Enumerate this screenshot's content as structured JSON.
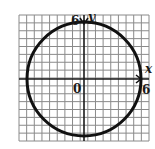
{
  "diagram": {
    "type": "circle-on-coordinate-grid",
    "equation_implied": "x^2 + y^2 = 36",
    "center": {
      "x": 0,
      "y": 0
    },
    "radius": 6,
    "axes": {
      "x_label": "x",
      "y_label": "y",
      "origin_label": "0"
    },
    "tick_labels": {
      "x_positive": "6",
      "y_positive": "6"
    },
    "grid": {
      "cols": 17,
      "rows": 16,
      "line_color": "#8a8a8a",
      "axis_color": "#1a1a1a",
      "curve_color": "#111111"
    }
  }
}
